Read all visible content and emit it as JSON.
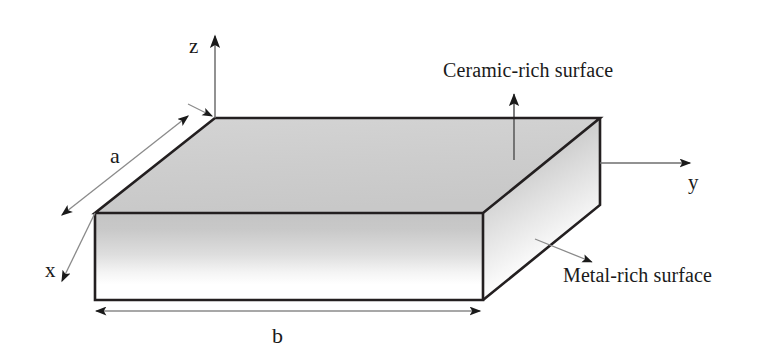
{
  "figure": {
    "type": "3d-plate-schematic",
    "axes": {
      "z": {
        "label": "z",
        "direction": "up"
      },
      "y": {
        "label": "y",
        "direction": "right"
      },
      "x": {
        "label": "x",
        "direction": "down-left"
      }
    },
    "dimensions": {
      "a": {
        "label": "a",
        "描述": "in-plane edge along x",
        "edge": "top-left-edge"
      },
      "b": {
        "label": "b",
        "edge": "bottom-front-edge"
      }
    },
    "annotations": {
      "ceramic": {
        "label": "Ceramic-rich surface",
        "points_to": "top-face"
      },
      "metal": {
        "label": "Metal-rich surface",
        "points_to": "bottom-face"
      }
    },
    "colors": {
      "outline": "#231f20",
      "top_face": "#cfcfcf",
      "front_face_top": "#c9c9c9",
      "front_face_bottom": "#ffffff",
      "side_face_top": "#c4c4c4",
      "side_face_bottom": "#fdfdfd",
      "leader_line": "#6e6e6e",
      "background": "#ffffff",
      "text": "#1a1a1a"
    }
  }
}
